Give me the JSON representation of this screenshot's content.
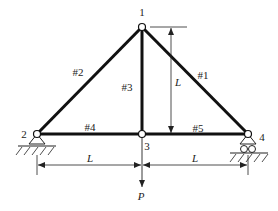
{
  "diagram": {
    "type": "truss",
    "nodes": [
      {
        "id": "1",
        "label": "1",
        "x": 142,
        "y": 27,
        "lx": 142,
        "ly": 16
      },
      {
        "id": "2",
        "label": "2",
        "x": 37,
        "y": 134,
        "lx": 24,
        "ly": 138
      },
      {
        "id": "3",
        "label": "3",
        "x": 142,
        "y": 134,
        "lx": 147,
        "ly": 150
      },
      {
        "id": "4",
        "label": "4",
        "x": 248,
        "y": 134,
        "lx": 262,
        "ly": 141
      }
    ],
    "members": [
      {
        "id": "#1",
        "label": "#1",
        "from": "1",
        "to": "4",
        "lx": 203,
        "ly": 79
      },
      {
        "id": "#2",
        "label": "#2",
        "from": "1",
        "to": "2",
        "lx": 78,
        "ly": 76
      },
      {
        "id": "#3",
        "label": "#3",
        "from": "1",
        "to": "3",
        "lx": 127,
        "ly": 91
      },
      {
        "id": "#4",
        "label": "#4",
        "from": "2",
        "to": "3",
        "lx": 90,
        "ly": 132
      },
      {
        "id": "#5",
        "label": "#5",
        "from": "3",
        "to": "4",
        "lx": 198,
        "ly": 133
      }
    ],
    "supports": [
      {
        "node": "2",
        "type": "pin"
      },
      {
        "node": "4",
        "type": "roller"
      }
    ],
    "dimensions": {
      "vertical": {
        "label": "L",
        "x": 171,
        "y1": 27,
        "y2": 134,
        "lx": 178,
        "ly": 86
      },
      "horizontal_left": {
        "label": "L",
        "x1": 37,
        "x2": 142,
        "y": 165,
        "lx": 90,
        "ly": 163
      },
      "horizontal_right": {
        "label": "L",
        "x1": 142,
        "x2": 248,
        "y": 165,
        "lx": 195,
        "ly": 163
      }
    },
    "load": {
      "label": "P",
      "node": "3",
      "direction": "down",
      "x": 142,
      "y1": 134,
      "y2": 187,
      "lx": 141,
      "ly": 200
    },
    "colors": {
      "member": "#111111",
      "line": "#222222",
      "node_fill": "#ffffff"
    }
  }
}
